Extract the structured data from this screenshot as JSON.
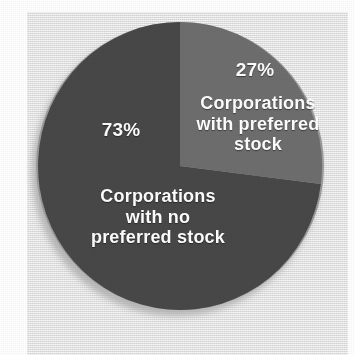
{
  "chart_data": {
    "type": "pie",
    "title": "",
    "subtitle": "",
    "xlabel": "",
    "ylabel": "",
    "legend_position": "none",
    "grid": false,
    "start_angle_deg": 0,
    "direction": "clockwise",
    "categories": [
      "Corporations with preferred stock",
      "Corporations with no preferred stock"
    ],
    "values": [
      27,
      73
    ],
    "units": "percent",
    "slices": [
      {
        "id": "preferred",
        "percent_label": "27%",
        "value": 27,
        "label": "Corporations\nwith preferred\nstock",
        "color": "#6e6e6e",
        "label_color": "#ffffff"
      },
      {
        "id": "no-preferred",
        "percent_label": "73%",
        "value": 73,
        "label": "Corporations\nwith no\npreferred stock",
        "color": "#484848",
        "label_color": "#ffffff"
      }
    ]
  },
  "colors": {
    "page_background": "#ffffff",
    "panel_background": "#e3e3e3",
    "slice_light": "#6e6e6e",
    "slice_dark": "#484848",
    "rim": "#9b9b9b",
    "shadow": "#b8b8b8",
    "label_text": "#ffffff"
  }
}
